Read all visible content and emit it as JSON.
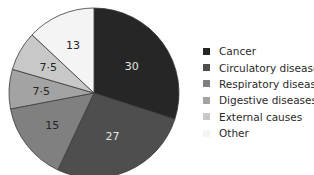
{
  "chart_data": {
    "type": "pie",
    "title": "",
    "categories": [
      "Cancer",
      "Circulatory diseases",
      "Respiratory diseases",
      "Digestive diseases",
      "External causes",
      "Other"
    ],
    "values": [
      30,
      27,
      15,
      7.5,
      7.5,
      13
    ],
    "value_labels": [
      "30",
      "27",
      "15",
      "7·5",
      "7·5",
      "13"
    ],
    "colors": [
      "#262626",
      "#4e4e4e",
      "#808080",
      "#a3a3a3",
      "#c8c8c8",
      "#f4f4f4"
    ],
    "label_colors": [
      "#e6e6e6",
      "#e6e6e6",
      "#262626",
      "#262626",
      "#262626",
      "#262626"
    ],
    "start_angle_deg": 0,
    "direction": "clockwise",
    "legend_position": "right"
  },
  "legend": {
    "items": [
      {
        "label": "Cancer",
        "color": "#262626"
      },
      {
        "label": "Circulatory diseases",
        "color": "#4e4e4e"
      },
      {
        "label": "Respiratory diseases",
        "color": "#808080"
      },
      {
        "label": "Digestive diseases",
        "color": "#a3a3a3"
      },
      {
        "label": "External causes",
        "color": "#c8c8c8"
      },
      {
        "label": "Other",
        "color": "#f4f4f4"
      }
    ]
  }
}
